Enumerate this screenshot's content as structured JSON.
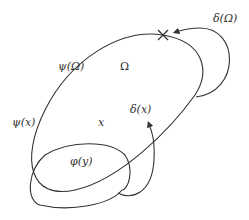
{
  "diagram": {
    "type": "set-mapping-illustration",
    "labels": {
      "delta_omega": "δ(Ω)",
      "psi_omega": "ψ(Ω)",
      "omega": "Ω",
      "psi_x": "ψ(x)",
      "x": "x",
      "delta_x": "δ(x)",
      "phi_y": "φ(y)"
    },
    "marks": {
      "cross": "×"
    },
    "colors": {
      "stroke": "#333333",
      "background": "#ffffff"
    }
  }
}
